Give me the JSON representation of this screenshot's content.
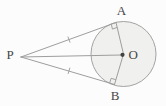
{
  "diagram": {
    "labels": {
      "external_point": "P",
      "tangent_point_top": "A",
      "tangent_point_bottom": "B",
      "center": "O"
    },
    "colors": {
      "background": "#fcfcfc",
      "line": "#9e9e9e",
      "circle_fill": "#f0f0ee",
      "circle_stroke": "#a3a3a3",
      "label_text": "#454545",
      "center_dot": "#424242"
    },
    "marks": {
      "right_angle_marks": [
        "at-A",
        "at-B"
      ],
      "equal_tick_marks": [
        "on-PA",
        "on-PB"
      ]
    }
  }
}
